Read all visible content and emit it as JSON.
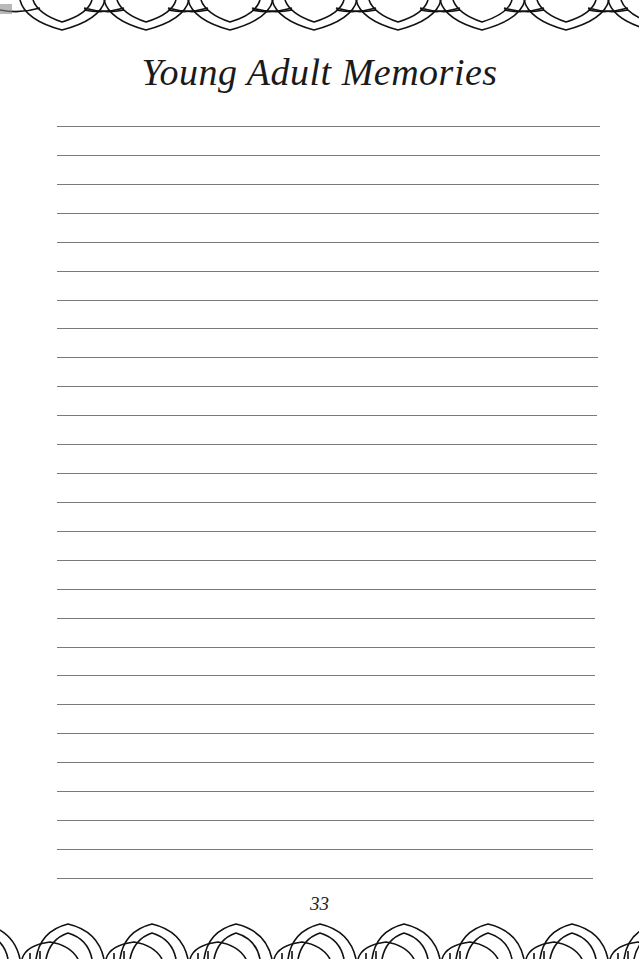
{
  "page": {
    "title": "Young Adult Memories",
    "page_number": "33",
    "writing_lines_count": 27,
    "line_color": "#7a7a7a",
    "ornament": "celtic-knot-border"
  }
}
